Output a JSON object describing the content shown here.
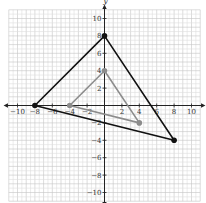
{
  "chart_data": {
    "type": "scatter",
    "title": "",
    "xlabel": "x",
    "ylabel": "y",
    "xlim": [
      -10,
      10
    ],
    "ylim": [
      -10,
      10
    ],
    "grid": true,
    "x_ticks": [
      -10,
      -8,
      -6,
      -4,
      -2,
      2,
      4,
      6,
      8,
      10
    ],
    "y_ticks": [
      10,
      8,
      6,
      4,
      2,
      -2,
      -4,
      -6,
      -8,
      -10
    ],
    "series": [
      {
        "name": "large triangle",
        "color": "#111111",
        "points": [
          [
            0,
            8
          ],
          [
            -8,
            0
          ],
          [
            8,
            -4
          ]
        ]
      },
      {
        "name": "small triangle",
        "color": "#8c8c8c",
        "points": [
          [
            0,
            4
          ],
          [
            -4,
            0
          ],
          [
            4,
            -2
          ]
        ]
      }
    ]
  }
}
